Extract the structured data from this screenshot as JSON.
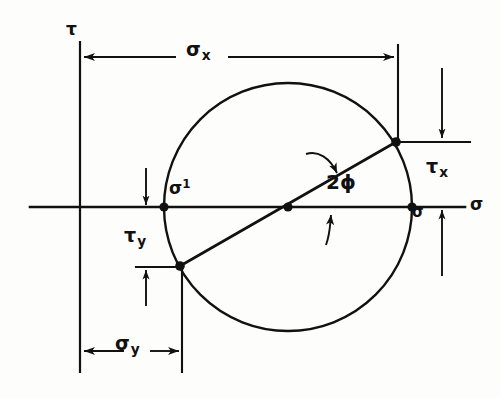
{
  "figure": {
    "background_color": "#fdfdfb",
    "stroke_color": "#111111"
  },
  "axes": {
    "vertical": {
      "label": "τ",
      "name": "tau-axis",
      "x": 80,
      "y_top": 42,
      "y_bottom": 372
    },
    "horizontal": {
      "label": "σ",
      "name": "sigma-axis",
      "y": 207,
      "x_left": 30,
      "x_right": 465
    }
  },
  "circle": {
    "center_x": 288,
    "center_y": 207,
    "radius": 124
  },
  "points": {
    "center": {
      "name": "circle-center",
      "x": 288,
      "y": 207,
      "label": ""
    },
    "sigma_1": {
      "name": "sigma-1-point",
      "x": 164,
      "y": 207,
      "label": "σ",
      "superscript": "1"
    },
    "sigma_2": {
      "name": "sigma-2-point",
      "x": 412,
      "y": 207,
      "label": "σ",
      "superscript": ""
    },
    "x_face": {
      "name": "x-face-point",
      "x": 396,
      "y": 142,
      "label": ""
    },
    "y_face": {
      "name": "y-face-point",
      "x": 180,
      "y": 266,
      "label": ""
    }
  },
  "labels": {
    "tau_axis": "τ",
    "sigma_axis": "σ",
    "sigma_x_base": "σ",
    "sigma_x_sub": "x",
    "sigma_y_base": "σ",
    "sigma_y_sub": "y",
    "tau_x_base": "τ",
    "tau_x_sub": "x",
    "tau_y_base": "τ",
    "tau_y_sub": "y",
    "sigma_prime_base": "σ",
    "sigma_prime_sup": "1",
    "sigma_right": "σ",
    "angle": "2",
    "angle_symbol": "ϕ"
  },
  "dimensions": [
    {
      "name": "sigma-x-dimension",
      "label": "σx",
      "orientation": "horizontal",
      "y": 57,
      "x_start": 80,
      "x_end": 397,
      "arrows": "both"
    },
    {
      "name": "sigma-y-dimension",
      "label": "σy",
      "orientation": "horizontal",
      "y": 351,
      "x_start": 80,
      "x_end": 182,
      "arrows": "both"
    },
    {
      "name": "tau-x-dimension",
      "label": "τx",
      "orientation": "vertical",
      "x": 442,
      "y_start": 68,
      "y_end": 140,
      "arrows": "down"
    },
    {
      "name": "tau-y-dimension",
      "label": "τy",
      "orientation": "vertical",
      "x": 146,
      "y_start": 168,
      "y_end": 207,
      "arrows": "down"
    },
    {
      "name": "tau-y-lower-dimension",
      "label": "τy",
      "orientation": "vertical",
      "x": 146,
      "y_start": 306,
      "y_end": 268,
      "arrows": "up"
    },
    {
      "name": "sigma-right-dimension",
      "label": "σ",
      "orientation": "vertical",
      "x": 442,
      "y_start": 276,
      "y_end": 209,
      "arrows": "up"
    }
  ],
  "angle_arcs": [
    {
      "name": "angle-arc-upper",
      "direction": "clockwise-to-radius"
    },
    {
      "name": "angle-arc-lower",
      "direction": "counterclockwise-to-axis"
    }
  ]
}
